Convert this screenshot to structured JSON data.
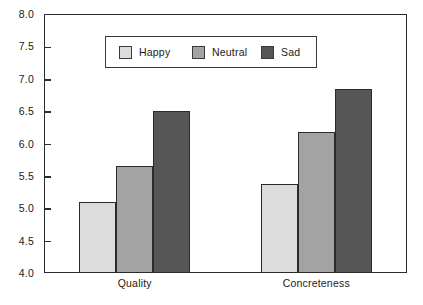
{
  "chart_data": {
    "type": "bar",
    "title": "",
    "subtitle": "",
    "xlabel": "",
    "ylabel": "",
    "categories": [
      "Quality",
      "Concreteness"
    ],
    "series": [
      {
        "name": "Happy",
        "color": "#dcdcdc",
        "values": [
          5.1,
          5.37
        ]
      },
      {
        "name": "Neutral",
        "color": "#a3a3a3",
        "values": [
          5.65,
          6.18
        ]
      },
      {
        "name": "Sad",
        "color": "#565656",
        "values": [
          6.5,
          6.84
        ]
      }
    ],
    "ylim": [
      4.0,
      8.0
    ],
    "ytick_values": [
      8.0,
      7.5,
      7.0,
      6.5,
      6.0,
      5.5,
      5.0,
      4.5,
      4.0
    ],
    "ytick_labels": [
      "8.0",
      "7.5",
      "7.0",
      "6.5",
      "6.0",
      "5.5",
      "5.0",
      "4.5",
      "4.0"
    ],
    "grid": false,
    "legend_position": "upper center",
    "frame_color": "#2b2b2b",
    "background_color": "#ffffff"
  }
}
